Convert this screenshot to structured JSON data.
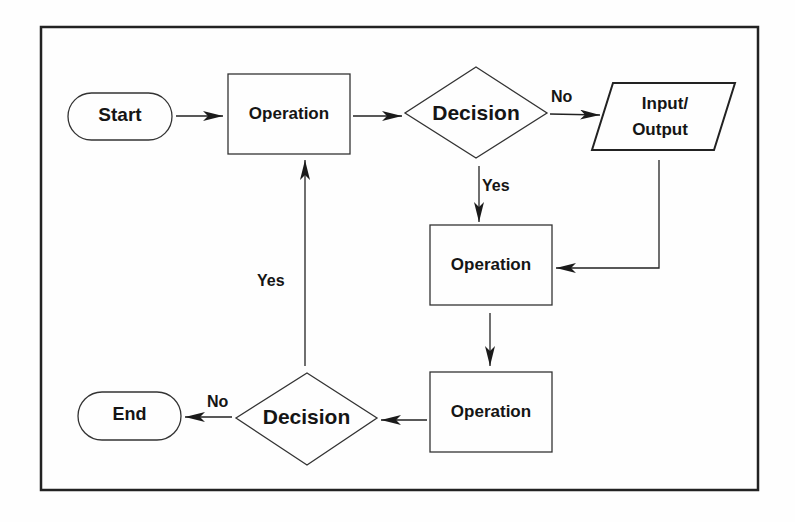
{
  "diagram": {
    "type": "flowchart",
    "nodes": {
      "start": {
        "shape": "terminator",
        "label": "Start"
      },
      "op1": {
        "shape": "process",
        "label": "Operation"
      },
      "decision1": {
        "shape": "decision",
        "label": "Decision"
      },
      "io": {
        "shape": "input-output",
        "label_line1": "Input/",
        "label_line2": "Output"
      },
      "op2": {
        "shape": "process",
        "label": "Operation"
      },
      "op3": {
        "shape": "process",
        "label": "Operation"
      },
      "decision2": {
        "shape": "decision",
        "label": "Decision"
      },
      "end": {
        "shape": "terminator",
        "label": "End"
      }
    },
    "edges": [
      {
        "from": "start",
        "to": "op1",
        "label": ""
      },
      {
        "from": "op1",
        "to": "decision1",
        "label": ""
      },
      {
        "from": "decision1",
        "to": "io",
        "label": "No"
      },
      {
        "from": "decision1",
        "to": "op2",
        "label": "Yes"
      },
      {
        "from": "io",
        "to": "op2",
        "label": ""
      },
      {
        "from": "op2",
        "to": "op3",
        "label": ""
      },
      {
        "from": "op3",
        "to": "decision2",
        "label": ""
      },
      {
        "from": "decision2",
        "to": "end",
        "label": "No"
      },
      {
        "from": "decision2",
        "to": "op1",
        "label": "Yes"
      }
    ],
    "edge_labels": {
      "d1_no": "No",
      "d1_yes": "Yes",
      "d2_no": "No",
      "d2_yes": "Yes"
    },
    "colors": {
      "stroke": "#222222",
      "text": "#151515",
      "background": "#fefefe"
    }
  }
}
